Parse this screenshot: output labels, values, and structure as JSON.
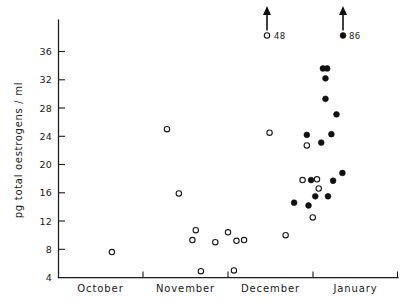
{
  "chart_data": {
    "type": "scatter",
    "title": "",
    "xlabel": "",
    "ylabel": "pg total oestrogens / ml",
    "ylim": [
      4,
      40
    ],
    "yticks": [
      4,
      8,
      12,
      16,
      20,
      24,
      28,
      32,
      36
    ],
    "ytick_labels": [
      "4",
      "8",
      "12",
      "16",
      "20",
      "24",
      "28",
      "32",
      "36"
    ],
    "xlim": [
      0,
      4
    ],
    "categories": [
      "October",
      "November",
      "December",
      "January"
    ],
    "xtick_positions": [
      0,
      1,
      2,
      3,
      4
    ],
    "grid": false,
    "legend_position": "none",
    "series": [
      {
        "name": "open-circle",
        "marker": "open circle",
        "color": "#1a1a1a",
        "points": [
          {
            "x": 0.63,
            "y": 7.6
          },
          {
            "x": 1.28,
            "y": 25.0
          },
          {
            "x": 1.42,
            "y": 15.9
          },
          {
            "x": 1.62,
            "y": 10.7
          },
          {
            "x": 1.58,
            "y": 9.3
          },
          {
            "x": 1.68,
            "y": 4.9
          },
          {
            "x": 1.85,
            "y": 9.0
          },
          {
            "x": 2.0,
            "y": 10.4
          },
          {
            "x": 2.1,
            "y": 9.2
          },
          {
            "x": 2.07,
            "y": 5.0
          },
          {
            "x": 2.19,
            "y": 9.3
          },
          {
            "x": 2.49,
            "y": 24.5
          },
          {
            "x": 2.68,
            "y": 10.0
          },
          {
            "x": 2.93,
            "y": 22.7
          },
          {
            "x": 2.88,
            "y": 17.8
          },
          {
            "x": 3.07,
            "y": 16.6
          },
          {
            "x": 3.05,
            "y": 17.9
          },
          {
            "x": 3.0,
            "y": 12.5
          }
        ]
      },
      {
        "name": "filled-circle",
        "marker": "filled circle",
        "color": "#101010",
        "points": [
          {
            "x": 3.12,
            "y": 33.6
          },
          {
            "x": 3.17,
            "y": 33.6
          },
          {
            "x": 3.15,
            "y": 32.2
          },
          {
            "x": 3.15,
            "y": 29.3
          },
          {
            "x": 3.28,
            "y": 27.1
          },
          {
            "x": 2.93,
            "y": 24.2
          },
          {
            "x": 3.22,
            "y": 24.3
          },
          {
            "x": 3.1,
            "y": 23.1
          },
          {
            "x": 3.35,
            "y": 18.8
          },
          {
            "x": 3.24,
            "y": 17.7
          },
          {
            "x": 2.98,
            "y": 17.8
          },
          {
            "x": 2.78,
            "y": 14.6
          },
          {
            "x": 3.03,
            "y": 15.5
          },
          {
            "x": 3.18,
            "y": 15.5
          },
          {
            "x": 2.95,
            "y": 14.2
          }
        ]
      }
    ],
    "annotations": [
      {
        "label": "48",
        "marker": "open circle",
        "value": 48,
        "x": 2.2,
        "note": "off-scale point indicated by upward arrow"
      },
      {
        "label": "86",
        "marker": "filled circle",
        "value": 86,
        "x": 3.13,
        "note": "off-scale point indicated by upward arrow"
      }
    ]
  },
  "axes": {
    "y_title": "pg total oestrogens / ml",
    "y_tick_labels": [
      "36",
      "32",
      "28",
      "24",
      "20",
      "16",
      "12",
      "8",
      "4"
    ],
    "x_tick_labels": [
      "October",
      "November",
      "December",
      "January"
    ]
  },
  "annotation_labels": {
    "left": "48",
    "right": "86"
  }
}
